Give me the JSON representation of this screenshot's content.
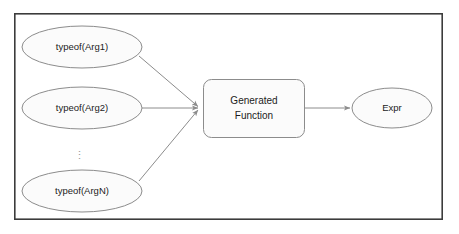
{
  "diagram": {
    "frame": {
      "name": "outer-border",
      "x": 14,
      "y": 13,
      "width": 429,
      "height": 207,
      "stroke": "#3c3c3c",
      "fill": "#ffffff",
      "stroke_width": 1.6
    },
    "style": {
      "shape_fill": "#fbfbfb",
      "shape_stroke": "#8c8c8c",
      "shape_stroke_width": 1,
      "arrow_stroke": "#8c8c8c",
      "arrow_stroke_width": 1,
      "text_color": "#1b1b1b",
      "background": "#ffffff",
      "ellipsis_color": "#9a9a9a"
    },
    "inputs": [
      {
        "id": "arg1",
        "label": "typeof(Arg1)",
        "cx": 82,
        "cy": 47,
        "rx": 60,
        "ry": 21
      },
      {
        "id": "arg2",
        "label": "typeof(Arg2)",
        "cx": 82,
        "cy": 108,
        "rx": 60,
        "ry": 21
      },
      {
        "id": "argn",
        "label": "typeof(ArgN)",
        "cx": 82,
        "cy": 191,
        "rx": 60,
        "ry": 21
      }
    ],
    "ellipsis": {
      "label": "⋮",
      "x": 79,
      "y": 155
    },
    "process": {
      "id": "generated-function",
      "label_line1": "Generated",
      "label_line2": "Function",
      "x": 203,
      "y": 79,
      "width": 102,
      "height": 59,
      "rx": 8
    },
    "output": {
      "id": "expr",
      "label": "Expr",
      "cx": 392,
      "cy": 108,
      "rx": 40,
      "ry": 20
    },
    "connectors": [
      {
        "id": "arg1-to-function",
        "x1": 139,
        "y1": 56,
        "x2": 199,
        "y2": 107
      },
      {
        "id": "arg2-to-function",
        "x1": 142,
        "y1": 108,
        "x2": 199,
        "y2": 108
      },
      {
        "id": "argn-to-function",
        "x1": 139,
        "y1": 181,
        "x2": 199,
        "y2": 110
      },
      {
        "id": "function-to-expr",
        "x1": 305,
        "y1": 108,
        "x2": 351,
        "y2": 108
      }
    ]
  }
}
